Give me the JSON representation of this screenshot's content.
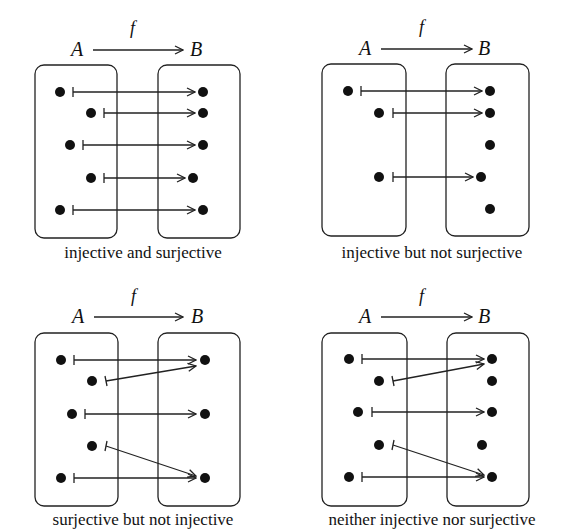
{
  "panels": [
    {
      "caption": "injective and surjective",
      "domain_label": "A",
      "codomain_label": "B",
      "function_label": "f",
      "domain_points": 5,
      "codomain_points": 5,
      "mapping": [
        [
          0,
          0
        ],
        [
          1,
          1
        ],
        [
          2,
          2
        ],
        [
          3,
          3
        ],
        [
          4,
          4
        ]
      ]
    },
    {
      "caption": "injective but not surjective",
      "domain_label": "A",
      "codomain_label": "B",
      "function_label": "f",
      "domain_points": 3,
      "codomain_points": 5,
      "mapping": [
        [
          0,
          0
        ],
        [
          1,
          1
        ],
        [
          2,
          3
        ]
      ]
    },
    {
      "caption": "surjective but not injective",
      "domain_label": "A",
      "codomain_label": "B",
      "function_label": "f",
      "domain_points": 5,
      "codomain_points": 3,
      "mapping": [
        [
          0,
          0
        ],
        [
          1,
          0
        ],
        [
          2,
          1
        ],
        [
          3,
          2
        ],
        [
          4,
          2
        ]
      ]
    },
    {
      "caption": "neither injective nor surjective",
      "domain_label": "A",
      "codomain_label": "B",
      "function_label": "f",
      "domain_points": 5,
      "codomain_points": 5,
      "mapping": [
        [
          0,
          0
        ],
        [
          1,
          0
        ],
        [
          2,
          2
        ],
        [
          3,
          4
        ],
        [
          4,
          4
        ]
      ]
    }
  ]
}
